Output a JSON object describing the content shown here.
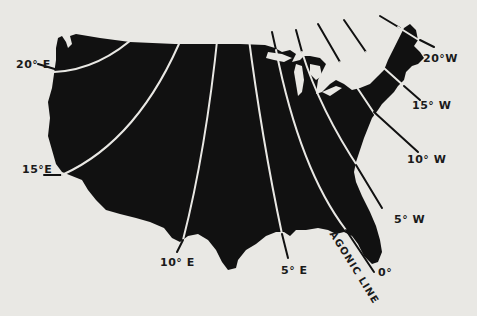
{
  "map": {
    "title": "Isogonic lines of magnetic declination over the United States",
    "colors": {
      "background": "#e9e8e4",
      "land": "#111111",
      "line_on_land": "#e9e8e4",
      "line_off_land": "#111111",
      "text": "#1a1a1a"
    },
    "isogonic_lines": [
      {
        "id": "20E",
        "label": "20° E",
        "value": 20,
        "direction": "E"
      },
      {
        "id": "15E",
        "label": "15°E",
        "value": 15,
        "direction": "E"
      },
      {
        "id": "10E",
        "label": "10° E",
        "value": 10,
        "direction": "E"
      },
      {
        "id": "5E",
        "label": "5° E",
        "value": 5,
        "direction": "E"
      },
      {
        "id": "0",
        "label": "0°",
        "value": 0,
        "direction": ""
      },
      {
        "id": "5W",
        "label": "5° W",
        "value": 5,
        "direction": "W"
      },
      {
        "id": "10W",
        "label": "10° W",
        "value": 10,
        "direction": "W"
      },
      {
        "id": "15W",
        "label": "15° W",
        "value": 15,
        "direction": "W"
      },
      {
        "id": "20W",
        "label": "20°W",
        "value": 20,
        "direction": "W"
      }
    ],
    "agonic_label": "AGONIC LINE"
  }
}
